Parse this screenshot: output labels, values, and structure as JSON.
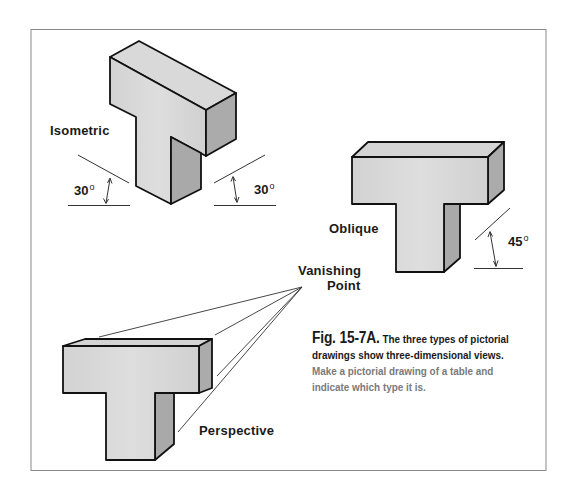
{
  "figure": {
    "border_color": "#8a8a8a",
    "face_light": "#d6d6d6",
    "face_dark": "#a9a9a9",
    "outline": "#111111"
  },
  "labels": {
    "isometric": "Isometric",
    "oblique": "Oblique",
    "perspective": "Perspective",
    "vanishing_line1": "Vanishing",
    "vanishing_line2": "Point"
  },
  "angles": {
    "iso_left": "30",
    "iso_right": "30",
    "oblique": "45",
    "degree_symbol": "o"
  },
  "caption": {
    "fig_number": "Fig. 15-7A.",
    "line1_rest": " The three types of pictorial",
    "line2": "drawings show three-dimensional views.",
    "line3": "Make a pictorial drawing of a table and",
    "line4": "indicate which type it is."
  }
}
